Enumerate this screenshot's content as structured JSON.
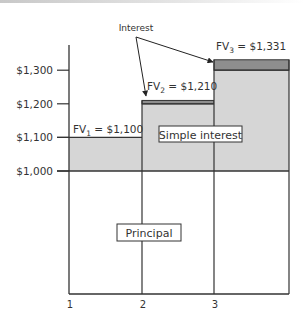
{
  "chart_data": {
    "type": "bar",
    "title": "",
    "xlabel": "",
    "ylabel": "",
    "x_ticks": [
      "1",
      "2",
      "3"
    ],
    "y_ticks": [
      {
        "value": 1000,
        "label": "$1,000"
      },
      {
        "value": 1100,
        "label": "$1,100"
      },
      {
        "value": 1200,
        "label": "$1,200"
      },
      {
        "value": 1300,
        "label": "$1,300"
      }
    ],
    "principal": 1000,
    "periods": [
      {
        "period": 1,
        "simple_value": 1100,
        "future_value": 1100,
        "label_prefix": "FV",
        "label_sub": "1",
        "label_value": " = $1,100"
      },
      {
        "period": 2,
        "simple_value": 1200,
        "future_value": 1210,
        "label_prefix": "FV",
        "label_sub": "2",
        "label_value": " = $1,210"
      },
      {
        "period": 3,
        "simple_value": 1300,
        "future_value": 1331,
        "label_prefix": "FV",
        "label_sub": "3",
        "label_value": " = $1,331"
      }
    ],
    "annotations": {
      "interest_label": "Interest",
      "simple_interest_label": "Simple interest",
      "principal_label": "Principal"
    },
    "colors": {
      "simple_interest_fill": "#d6d6d6",
      "compound_interest_fill": "#8e8e8e",
      "line": "#333333"
    }
  }
}
